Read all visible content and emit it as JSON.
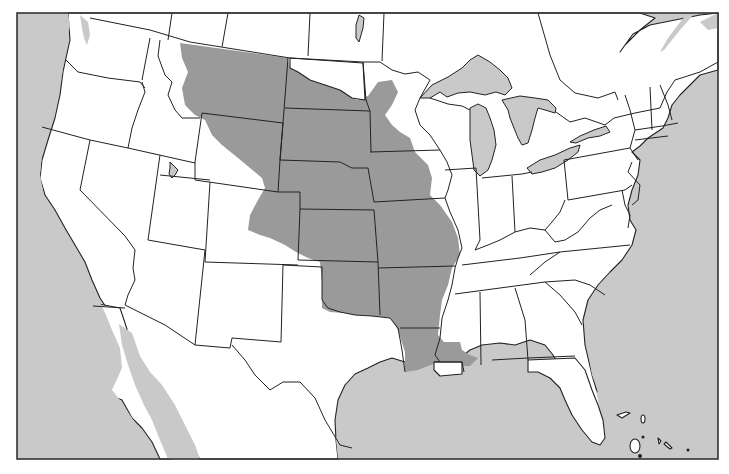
{
  "map": {
    "title": "",
    "colors": {
      "water": "#c9c9c9",
      "land": "#ffffff",
      "highlight": "#9a9a9a",
      "border": "#222222",
      "frame": "#333333"
    },
    "frame": {
      "x": 17,
      "y": 13,
      "width": 701,
      "height": 446
    },
    "highlighted_region": {
      "description": "Shaded region covering central Great Plains and lower Mississippi valley",
      "states": [
        "Montana (east)",
        "Wyoming (east)",
        "Colorado (east)",
        "North Dakota (partial)",
        "South Dakota",
        "Nebraska",
        "Kansas",
        "Oklahoma",
        "Minnesota (west)",
        "Iowa",
        "Missouri",
        "Arkansas",
        "Louisiana"
      ]
    },
    "legend": [],
    "labels": []
  }
}
